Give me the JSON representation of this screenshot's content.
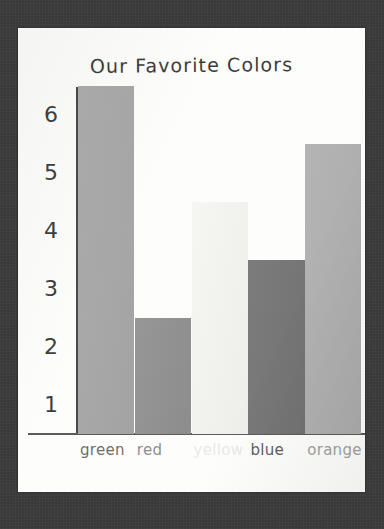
{
  "scene": {
    "backdrop_color": "#3b3b3b",
    "paper_color": "#fdfdfb"
  },
  "chart_data": {
    "type": "bar",
    "title": "Our Favorite Colors",
    "xlabel": "",
    "ylabel": "",
    "categories": [
      "green",
      "red",
      "yellow",
      "blue",
      "orange"
    ],
    "values": [
      6,
      2,
      4,
      3,
      5
    ],
    "ylim": [
      0,
      6
    ],
    "yticks": [
      "6",
      "5",
      "4",
      "3",
      "2",
      "1"
    ],
    "ytick_values": [
      6,
      5,
      4,
      3,
      2,
      1
    ],
    "grid": false,
    "legend": "none",
    "bar_colors": [
      "#a8a8a8",
      "#919191",
      "#f5f5f2",
      "#757575",
      "#b0b0b0"
    ],
    "label_colors": [
      "#6f6f6f",
      "#8e8e8e",
      "#e9e9e6",
      "#5d5d5d",
      "#a0a0a0"
    ]
  }
}
